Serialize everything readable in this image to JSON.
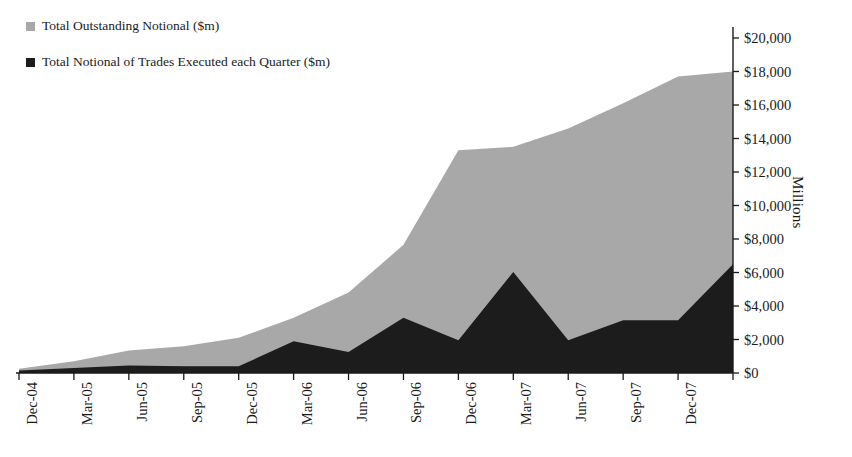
{
  "legend": {
    "items": [
      {
        "label": "Total Outstanding Notional ($m)",
        "color": "#a8a8a8",
        "swatch": "legend-swatch-gray"
      },
      {
        "label": "Total Notional of Trades Executed each Quarter ($m)",
        "color": "#1c1c1c",
        "swatch": "legend-swatch-black"
      }
    ]
  },
  "axis_title_y": "Millions",
  "chart_data": {
    "type": "area",
    "title": "",
    "xlabel": "",
    "ylabel": "Millions",
    "ylim": [
      0,
      20000
    ],
    "ytick_labels": [
      "$20,000",
      "$18,000",
      "$16,000",
      "$14,000",
      "$12,000",
      "$10,000",
      "$8,000",
      "$6,000",
      "$4,000",
      "$2,000",
      "$0"
    ],
    "ytick_values": [
      20000,
      18000,
      16000,
      14000,
      12000,
      10000,
      8000,
      6000,
      4000,
      2000,
      0
    ],
    "ytick_interval": 2000,
    "grid": false,
    "legend_position": "top-left",
    "categories": [
      "Dec-04",
      "Mar-05",
      "Jun-05",
      "Sep-05",
      "Dec-05",
      "Mar-06",
      "Jun-06",
      "Sep-06",
      "Dec-06",
      "Mar-07",
      "Jun-07",
      "Sep-07",
      "Dec-07",
      ""
    ],
    "series": [
      {
        "name": "Total Outstanding Notional ($m)",
        "color": "#a8a8a8",
        "values": [
          250,
          700,
          1350,
          1600,
          2100,
          3300,
          4800,
          7650,
          13300,
          13500,
          14600,
          16100,
          17700,
          18000
        ]
      },
      {
        "name": "Total Notional of Trades Executed each Quarter ($m)",
        "color": "#1c1c1c",
        "values": [
          150,
          300,
          450,
          400,
          400,
          1900,
          1250,
          3300,
          1950,
          6030,
          1950,
          3150,
          3150,
          6500
        ]
      }
    ]
  }
}
